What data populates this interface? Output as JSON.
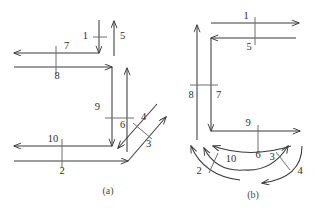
{
  "figure": {
    "width": 330,
    "height": 210,
    "background": "#ffffff",
    "stroke_color": "#3a3a3a",
    "label_color": "#2e2e2e",
    "tick_color": "#6f6f6f"
  },
  "panels": [
    {
      "id": "a",
      "caption": "(a)",
      "description": "staircase routing diagram with straight orthogonal and diagonal arrows",
      "arrows": [
        {
          "label": "1",
          "direction": "down",
          "shape": "straight"
        },
        {
          "label": "5",
          "direction": "up",
          "shape": "straight"
        },
        {
          "label": "7",
          "direction": "left",
          "shape": "straight"
        },
        {
          "label": "8",
          "direction": "right",
          "shape": "straight"
        },
        {
          "label": "9",
          "direction": "down",
          "shape": "straight"
        },
        {
          "label": "6",
          "direction": "up",
          "shape": "straight"
        },
        {
          "label": "4",
          "direction": "down-left",
          "shape": "diagonal"
        },
        {
          "label": "3",
          "direction": "up-right",
          "shape": "diagonal"
        },
        {
          "label": "10",
          "direction": "left",
          "shape": "straight"
        },
        {
          "label": "2",
          "direction": "right",
          "shape": "straight"
        }
      ]
    },
    {
      "id": "b",
      "caption": "(b)",
      "description": "routing diagram with straight orthogonal arrows on top and curved arrows at bottom",
      "arrows": [
        {
          "label": "1",
          "direction": "right",
          "shape": "straight"
        },
        {
          "label": "5",
          "direction": "left",
          "shape": "straight"
        },
        {
          "label": "8",
          "direction": "up",
          "shape": "straight"
        },
        {
          "label": "7",
          "direction": "down",
          "shape": "straight"
        },
        {
          "label": "9",
          "direction": "right",
          "shape": "straight"
        },
        {
          "label": "6",
          "direction": "left",
          "shape": "curved"
        },
        {
          "label": "10",
          "direction": "up-left",
          "shape": "curved"
        },
        {
          "label": "2",
          "direction": "up-left",
          "shape": "curved"
        },
        {
          "label": "3",
          "direction": "up-right",
          "shape": "curved"
        },
        {
          "label": "4",
          "direction": "down-left",
          "shape": "curved"
        }
      ]
    }
  ],
  "labels": {
    "a1": "1",
    "a5": "5",
    "a7": "7",
    "a8": "8",
    "a9": "9",
    "a6": "6",
    "a4": "4",
    "a3": "3",
    "a10": "10",
    "a2": "2",
    "b1": "1",
    "b5": "5",
    "b8": "8",
    "b7": "7",
    "b9": "9",
    "b6": "6",
    "b10": "10",
    "b2": "2",
    "b3": "3",
    "b4": "4",
    "caption_a": "(a)",
    "caption_b": "(b)"
  }
}
